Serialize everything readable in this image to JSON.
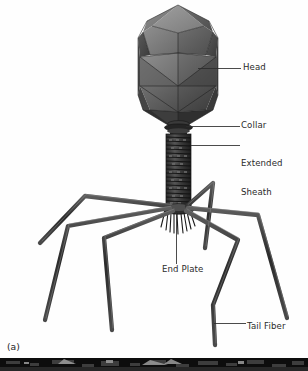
{
  "figure": {
    "panel_letter": "(a)",
    "background_color": "#ffffff",
    "ink_color": "#2b2b2b",
    "labels": [
      {
        "id": "head",
        "text": "Head",
        "leader": "horizontal-left"
      },
      {
        "id": "collar",
        "text": "Collar",
        "leader": "horizontal-left"
      },
      {
        "id": "sheath",
        "text": "Extended\nSheath",
        "leader": "horizontal-left"
      },
      {
        "id": "end_plate",
        "text": "End Plate",
        "leader": "vertical-up"
      },
      {
        "id": "tail_fiber",
        "text": "Tail Fiber",
        "leader": "horizontal-left"
      }
    ],
    "label_text": {
      "head": "Head",
      "collar": "Collar",
      "sheath_line1": "Extended",
      "sheath_line2": "Sheath",
      "end_plate": "End Plate",
      "tail_fiber": "Tail Fiber"
    }
  }
}
